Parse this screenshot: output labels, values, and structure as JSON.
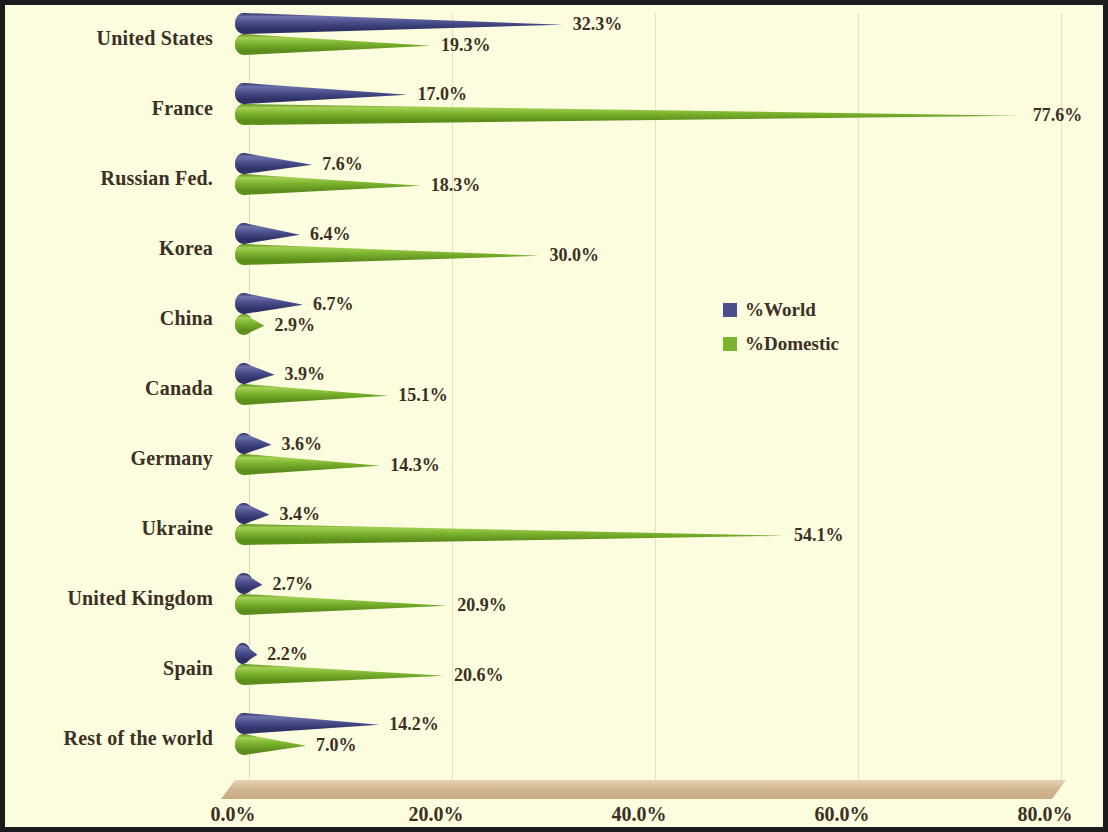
{
  "chart_data": {
    "type": "bar",
    "orientation": "horizontal",
    "title": "",
    "subtitle": "",
    "xlabel": "",
    "ylabel": "",
    "xlim": [
      0,
      80
    ],
    "xticks": [
      "0.0%",
      "20.0%",
      "40.0%",
      "60.0%",
      "80.0%"
    ],
    "xtick_values": [
      0,
      20,
      40,
      60,
      80
    ],
    "grid": true,
    "legend_position": "middle-right",
    "categories": [
      "United States",
      "France",
      "Russian Fed.",
      "Korea",
      "China",
      "Canada",
      "Germany",
      "Ukraine",
      "United Kingdom",
      "Spain",
      "Rest of the world"
    ],
    "series": [
      {
        "name": "%World",
        "color": "#4a4e8c",
        "values": [
          32.3,
          17.0,
          7.6,
          6.4,
          6.7,
          3.9,
          3.6,
          3.4,
          2.7,
          2.2,
          14.2
        ],
        "labels": [
          "32.3%",
          "17.0%",
          "7.6%",
          "6.4%",
          "6.7%",
          "3.9%",
          "3.6%",
          "3.4%",
          "2.7%",
          "2.2%",
          "14.2%"
        ]
      },
      {
        "name": "%Domestic",
        "color": "#7bb32e",
        "values": [
          19.3,
          77.6,
          18.3,
          30.0,
          2.9,
          15.1,
          14.3,
          54.1,
          20.9,
          20.6,
          7.0
        ],
        "labels": [
          "19.3%",
          "77.6%",
          "18.3%",
          "30.0%",
          "2.9%",
          "15.1%",
          "14.3%",
          "54.1%",
          "20.9%",
          "20.6%",
          "7.0%"
        ]
      }
    ]
  },
  "legend": {
    "items": [
      {
        "label": "%World",
        "color": "#4a4e8c"
      },
      {
        "label": "%Domestic",
        "color": "#7bb32e"
      }
    ]
  },
  "colors": {
    "background": "#fcfcdf",
    "border": "#1c1c1c",
    "gridline": "#e4e0c0",
    "floor": "#d6bd9a",
    "text": "#3b3024",
    "series_world": "#4a4e8c",
    "series_domestic": "#7bb32e"
  }
}
